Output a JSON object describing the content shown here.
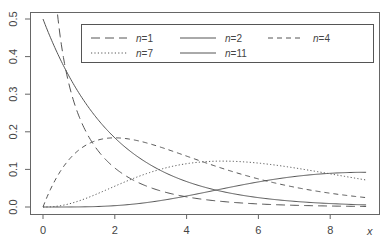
{
  "chart_data": {
    "type": "line",
    "title": "",
    "xlabel": "x",
    "ylabel": "",
    "xlim": [
      -0.3,
      9.5
    ],
    "ylim": [
      -0.02,
      0.51
    ],
    "x_ticks": [
      0,
      2,
      4,
      6,
      8
    ],
    "x_tick_labels": [
      "0",
      "2",
      "4",
      "6",
      "8"
    ],
    "y_ticks": [
      0.0,
      0.1,
      0.2,
      0.3,
      0.4,
      0.5
    ],
    "y_tick_labels": [
      "0.0",
      "0.1",
      "0.2",
      "0.3",
      "0.4",
      "0.5"
    ],
    "grid": false,
    "legend_position": "top-inside",
    "x_range_of_curves": [
      0,
      9
    ],
    "series": [
      {
        "name": "n=1",
        "n_label": "n",
        "n_value": "1",
        "df": 1,
        "dash": "9,5",
        "width": 1.0,
        "color": "#555555",
        "sample": {
          "x": [
            0.5,
            1,
            2,
            4,
            6,
            8,
            9
          ],
          "y": [
            0.439,
            0.242,
            0.104,
            0.027,
            0.008,
            0.002,
            0.001
          ]
        }
      },
      {
        "name": "n=2",
        "n_label": "n",
        "n_value": "2",
        "df": 2,
        "dash": "",
        "width": 1.0,
        "color": "#555555",
        "sample": {
          "x": [
            0,
            1,
            2,
            4,
            6,
            8,
            9
          ],
          "y": [
            0.5,
            0.303,
            0.184,
            0.068,
            0.025,
            0.009,
            0.006
          ]
        }
      },
      {
        "name": "n=4",
        "n_label": "n",
        "n_value": "4",
        "df": 4,
        "dash": "5,4",
        "width": 1.0,
        "color": "#555555",
        "sample": {
          "x": [
            0,
            1,
            2,
            4,
            6,
            8,
            9
          ],
          "y": [
            0.0,
            0.152,
            0.184,
            0.135,
            0.075,
            0.037,
            0.025
          ]
        }
      },
      {
        "name": "n=7",
        "n_label": "n",
        "n_value": "7",
        "df": 7,
        "dash": "1.2,2.2",
        "width": 1.0,
        "color": "#555555",
        "sample": {
          "x": [
            0,
            1,
            2,
            4,
            5,
            6,
            8,
            9
          ],
          "y": [
            0.0,
            0.014,
            0.052,
            0.111,
            0.12,
            0.115,
            0.09,
            0.077
          ]
        }
      },
      {
        "name": "n=11",
        "n_label": "n",
        "n_value": "11",
        "df": 11,
        "dash": "",
        "width": 1.0,
        "color": "#555555",
        "sample": {
          "x": [
            0,
            2,
            4,
            6,
            8,
            9
          ],
          "y": [
            0.0,
            0.004,
            0.033,
            0.072,
            0.089,
            0.091
          ]
        }
      }
    ],
    "legend": {
      "rows": [
        [
          "n=1",
          "n=2",
          "n=4"
        ],
        [
          "n=7",
          "n=11"
        ]
      ]
    }
  },
  "colors": {
    "axis": "#555555",
    "line": "#555555",
    "background": "#ffffff"
  }
}
